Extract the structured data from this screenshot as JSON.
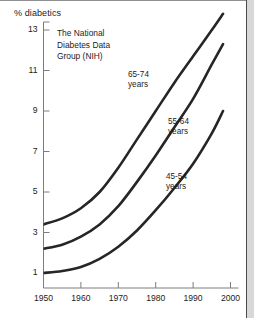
{
  "chart_data": {
    "type": "line",
    "title": "",
    "annotation": "The National\nDiabetes Data\nGroup (NIH)",
    "annotation_lines": [
      "The National",
      "Diabetes Data",
      "Group (NIH)"
    ],
    "xlabel": "",
    "ylabel": "% diabetics",
    "xlim": [
      1950,
      2000
    ],
    "ylim": [
      0,
      13.8
    ],
    "xticks": [
      1950,
      1960,
      1970,
      1980,
      1990,
      2000
    ],
    "xticklabels": [
      "1950",
      "1960",
      "1970",
      "1980",
      "1990",
      "2000"
    ],
    "yticks": [
      1,
      3,
      5,
      7,
      9,
      11,
      13
    ],
    "yticklabels": [
      "1",
      "3",
      "5",
      "7",
      "9",
      "11",
      "13"
    ],
    "grid": false,
    "legend_position": "inline-labels",
    "line_color": "#262626",
    "line_width_px": 2.6,
    "x": [
      1950,
      1955,
      1960,
      1965,
      1970,
      1975,
      1980,
      1985,
      1990,
      1995,
      1998
    ],
    "series": [
      {
        "name": "65-74 years",
        "label_lines": [
          "65-74",
          "years"
        ],
        "values": [
          3.4,
          3.7,
          4.2,
          5.0,
          6.2,
          7.6,
          9.0,
          10.4,
          11.7,
          13.0,
          13.8
        ]
      },
      {
        "name": "55-64 years",
        "label_lines": [
          "55-64",
          "years"
        ],
        "values": [
          2.2,
          2.4,
          2.8,
          3.4,
          4.3,
          5.5,
          6.8,
          8.2,
          9.6,
          11.3,
          12.3
        ]
      },
      {
        "name": "45-54 years",
        "label_lines": [
          "45-54",
          "years"
        ],
        "values": [
          1.0,
          1.1,
          1.3,
          1.7,
          2.3,
          3.1,
          4.1,
          5.2,
          6.4,
          7.9,
          9.0
        ]
      }
    ]
  },
  "axes": {
    "y_title": "% diabetics"
  }
}
